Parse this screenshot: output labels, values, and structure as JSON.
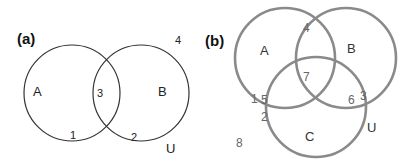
{
  "colors": {
    "background": "#ffffff",
    "panel_a_stroke": "#333333",
    "panel_b_stroke": "#8a8a8a",
    "text_dark": "#222222",
    "text_gray": "#666666"
  },
  "panel_a": {
    "label": "(a)",
    "universe_label": "U",
    "sets": [
      {
        "name": "A",
        "cx": 72,
        "cy": 93,
        "r": 48
      },
      {
        "name": "B",
        "cx": 141,
        "cy": 93,
        "r": 48
      }
    ],
    "set_labels": {
      "A": "A",
      "B": "B"
    },
    "regions": {
      "A_only_boundary": "1",
      "A_and_B": "3",
      "B_only_boundary": "2",
      "outside": "4"
    }
  },
  "panel_b": {
    "label": "(b)",
    "universe_label": "U",
    "sets": [
      {
        "name": "A",
        "cx": 285,
        "cy": 58,
        "r": 50
      },
      {
        "name": "B",
        "cx": 346,
        "cy": 58,
        "r": 50
      },
      {
        "name": "C",
        "cx": 316,
        "cy": 107,
        "r": 50
      }
    ],
    "set_labels": {
      "A": "A",
      "B": "B",
      "C": "C"
    },
    "regions": {
      "A_B_top": "4",
      "A_B_C": "7",
      "A_boundary_left": "1",
      "A_C": "5",
      "C_boundary_left": "2",
      "B_C": "6",
      "B_boundary_right": "3",
      "outside": "8"
    }
  }
}
